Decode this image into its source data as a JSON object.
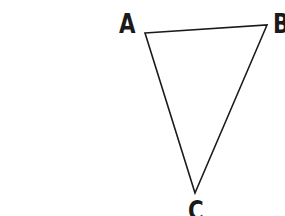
{
  "diagram": {
    "type": "triangle",
    "stroke_color": "#1a1a1a",
    "background": "#ffffff",
    "vertices": [
      {
        "name": "A",
        "label": "A",
        "x": 145,
        "y": 33,
        "label_x": 119,
        "label_y": 11
      },
      {
        "name": "B",
        "label": "B",
        "x": 267,
        "y": 25,
        "label_x": 273,
        "label_y": 11
      },
      {
        "name": "C",
        "label": "C",
        "x": 195,
        "y": 193,
        "label_x": 188,
        "label_y": 198
      }
    ],
    "edges": [
      {
        "from": "A",
        "to": "B"
      },
      {
        "from": "B",
        "to": "C"
      },
      {
        "from": "C",
        "to": "A"
      }
    ]
  }
}
